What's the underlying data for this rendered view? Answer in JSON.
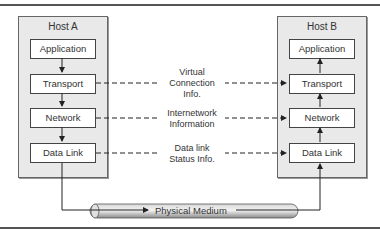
{
  "diagram": {
    "host_a": {
      "title": "Host A",
      "layers": [
        "Application",
        "Transport",
        "Network",
        "Data Link"
      ]
    },
    "host_b": {
      "title": "Host B",
      "layers": [
        "Application",
        "Transport",
        "Network",
        "Data Link"
      ]
    },
    "peer_links": [
      {
        "line1": "Virtual",
        "line2": "Connection",
        "line3": "Info."
      },
      {
        "line1": "Internetwork",
        "line2": "Information"
      },
      {
        "line1": "Data link",
        "line2": "Status Info."
      }
    ],
    "medium": {
      "label": "Physical Medium"
    },
    "colors": {
      "panel": "#e9e9e9",
      "box_border": "#444444",
      "rule": "#555555",
      "pipe": "#b5b5b5"
    }
  }
}
